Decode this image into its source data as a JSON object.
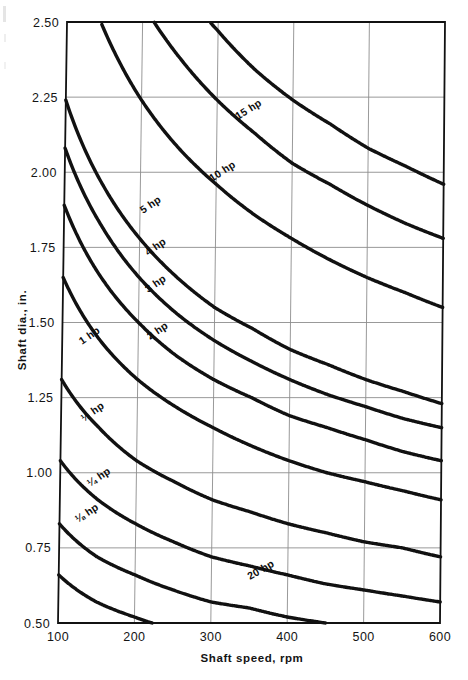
{
  "figure": {
    "background_color": "#ffffff",
    "ink_color": "#111111",
    "grid_color": "#8d8d8d",
    "curve_color": "#111111"
  },
  "axes": {
    "x": {
      "label": "Shaft speed, rpm",
      "ticks": [
        "100",
        "200",
        "300",
        "400",
        "500",
        "600"
      ],
      "min": 100,
      "max": 600
    },
    "y": {
      "label": "Shaft dia., in.",
      "ticks": [
        "0.50",
        "0.75",
        "1.00",
        "1.25",
        "1.50",
        "1.75",
        "2.00",
        "2.25",
        "2.50"
      ],
      "min": 0.5,
      "max": 2.5
    }
  },
  "curve_labels": [
    {
      "text": "20 hp",
      "x": 250,
      "y": 580,
      "rot": -30
    },
    {
      "text": "15 hp",
      "x": 238,
      "y": 120,
      "rot": -32
    },
    {
      "text": "10 hp",
      "x": 212,
      "y": 182,
      "rot": -33
    },
    {
      "text": "5 hp",
      "x": 143,
      "y": 214,
      "rot": -34
    },
    {
      "text": "4 hp",
      "x": 148,
      "y": 256,
      "rot": -34
    },
    {
      "text": "3 hp",
      "x": 148,
      "y": 293,
      "rot": -34
    },
    {
      "text": "2 hp",
      "x": 150,
      "y": 340,
      "rot": -34
    },
    {
      "text": "1 hp",
      "x": 82,
      "y": 345,
      "rot": -35
    },
    {
      "text": "½ hp",
      "x": 84,
      "y": 422,
      "rot": -35
    },
    {
      "text": "¼ hp",
      "x": 90,
      "y": 487,
      "rot": -34
    },
    {
      "text": "⅛ hp",
      "x": 78,
      "y": 523,
      "rot": -34
    }
  ],
  "chart_data": {
    "type": "line",
    "title": "",
    "xlabel": "Shaft speed, rpm",
    "ylabel": "Shaft dia., in.",
    "xlim": [
      100,
      600
    ],
    "ylim": [
      0.5,
      2.5
    ],
    "xticks": [
      100,
      200,
      300,
      400,
      500,
      600
    ],
    "yticks": [
      0.5,
      0.75,
      1.0,
      1.25,
      1.5,
      1.75,
      2.0,
      2.25,
      2.5
    ],
    "grid": true,
    "legend": "inline curve labels",
    "x": [
      100,
      150,
      200,
      250,
      300,
      350,
      400,
      450,
      500,
      550,
      600
    ],
    "series": [
      {
        "name": "20 hp",
        "label": "20 hp",
        "values": [
          3.56,
          3.11,
          2.83,
          2.62,
          2.47,
          2.34,
          2.24,
          2.16,
          2.08,
          2.02,
          1.96
        ]
      },
      {
        "name": "15 hp",
        "label": "15 hp",
        "values": [
          3.23,
          2.82,
          2.56,
          2.38,
          2.24,
          2.13,
          2.03,
          1.96,
          1.89,
          1.83,
          1.78
        ]
      },
      {
        "name": "10 hp",
        "label": "10 hp",
        "values": [
          2.83,
          2.47,
          2.24,
          2.08,
          1.96,
          1.86,
          1.78,
          1.71,
          1.65,
          1.6,
          1.55
        ]
      },
      {
        "name": "5 hp",
        "label": "5 hp",
        "values": [
          2.24,
          1.96,
          1.78,
          1.65,
          1.55,
          1.48,
          1.41,
          1.36,
          1.31,
          1.27,
          1.23
        ]
      },
      {
        "name": "4 hp",
        "label": "4 hp",
        "values": [
          2.08,
          1.82,
          1.65,
          1.53,
          1.44,
          1.37,
          1.31,
          1.26,
          1.22,
          1.18,
          1.15
        ]
      },
      {
        "name": "3 hp",
        "label": "3 hp",
        "values": [
          1.89,
          1.65,
          1.5,
          1.39,
          1.31,
          1.25,
          1.19,
          1.15,
          1.11,
          1.07,
          1.04
        ]
      },
      {
        "name": "2 hp",
        "label": "2 hp",
        "values": [
          1.65,
          1.44,
          1.31,
          1.22,
          1.15,
          1.09,
          1.04,
          1.0,
          0.97,
          0.94,
          0.91
        ]
      },
      {
        "name": "1 hp",
        "label": "1 hp",
        "values": [
          1.31,
          1.15,
          1.04,
          0.97,
          0.91,
          0.87,
          0.83,
          0.8,
          0.77,
          0.75,
          0.72
        ]
      },
      {
        "name": "1/2 hp",
        "label": "½ hp",
        "values": [
          1.04,
          0.91,
          0.83,
          0.77,
          0.72,
          0.69,
          0.66,
          0.63,
          0.61,
          0.59,
          0.57
        ]
      },
      {
        "name": "1/4 hp",
        "label": "¼ hp",
        "values": [
          0.83,
          0.72,
          0.66,
          0.61,
          0.57,
          0.55,
          0.52,
          0.5,
          0.49,
          0.47,
          0.46
        ]
      },
      {
        "name": "1/8 hp",
        "label": "⅛ hp",
        "values": [
          0.66,
          0.57,
          0.52,
          0.48,
          0.46,
          0.43,
          0.42,
          0.4,
          0.38,
          0.37,
          0.36
        ]
      }
    ]
  }
}
